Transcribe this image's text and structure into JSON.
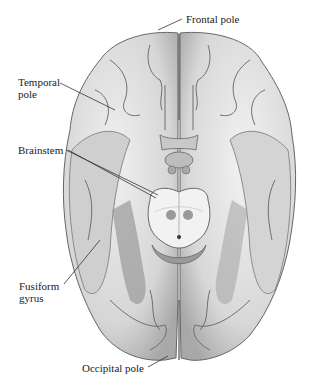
{
  "figure": {
    "labels": {
      "frontal_pole": "Frontal pole",
      "temporal_pole_line1": "Temporal",
      "temporal_pole_line2": "pole",
      "brainstem": "Brainstem",
      "fusiform_line1": "Fusiform",
      "fusiform_line2": "gyrus",
      "occipital_pole": "Occipital pole"
    },
    "colors": {
      "cortex_fill": "#e6e6e6",
      "cortex_shade": "#b5b5b5",
      "sulcus": "#6e6e6e",
      "brainstem_fill": "#f2f2f2",
      "nucleus": "#9a9a9a",
      "leader_line": "#333333"
    }
  }
}
